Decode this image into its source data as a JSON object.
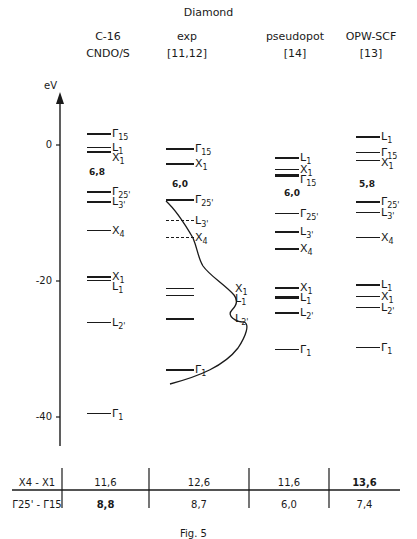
{
  "title": "Diamond",
  "axis": {
    "unit": "eV",
    "ticks": [
      {
        "label": "0",
        "value": 0
      },
      {
        "label": "-20",
        "value": -20
      },
      {
        "label": "-40",
        "value": -40
      }
    ]
  },
  "columns": [
    {
      "line1": "C-16",
      "line2": "CNDO/S",
      "gap": "6,8",
      "levels": [
        {
          "label": "Γ15",
          "e": 1.7
        },
        {
          "label": "L1",
          "e": -0.3
        },
        {
          "label": "X1",
          "e": -0.9
        },
        {
          "label": "Γ25'",
          "e": -6.8
        },
        {
          "label": "L3'",
          "e": -8.3
        },
        {
          "label": "X4",
          "e": -12.5
        },
        {
          "label": "X1",
          "e": -19.3
        },
        {
          "label": "L1",
          "e": -19.8
        },
        {
          "label": "L2'",
          "e": -26.0
        },
        {
          "label": "Γ1",
          "e": -39.4
        }
      ]
    },
    {
      "line1": "exp",
      "line2": "[11,12]",
      "gap": "6,0",
      "levels": [
        {
          "label": "Γ15",
          "e": -0.5
        },
        {
          "label": "X1",
          "e": -2.7
        },
        {
          "label": "Γ25'",
          "e": -8.0
        },
        {
          "label": "L3'",
          "e": -11.0,
          "dashed": true
        },
        {
          "label": "X4",
          "e": -13.5,
          "dashed": true
        },
        {
          "label": "X1",
          "e": -21.0
        },
        {
          "label": "L1",
          "e": -22.0
        },
        {
          "label": "L2'",
          "e": -25.5
        },
        {
          "label": "Γ1",
          "e": -33.0
        }
      ]
    },
    {
      "line1": "pseudopot",
      "line2": "[14]",
      "gap": "6,0",
      "levels": [
        {
          "label": "L1",
          "e": -1.8
        },
        {
          "label": "X1",
          "e": -3.5
        },
        {
          "label": "Γ15",
          "e": -4.2,
          "thick": true
        },
        {
          "label": "Γ25'",
          "e": -10.0
        },
        {
          "label": "L3'",
          "e": -12.7
        },
        {
          "label": "X4",
          "e": -15.2
        },
        {
          "label": "X1",
          "e": -20.9
        },
        {
          "label": "L1",
          "e": -22.2,
          "thick": true
        },
        {
          "label": "L2'",
          "e": -24.6
        },
        {
          "label": "Γ1",
          "e": -30.0
        }
      ]
    },
    {
      "line1": "OPW-SCF",
      "line2": "[13]",
      "gap": "5,8",
      "levels": [
        {
          "label": "L1",
          "e": 1.3
        },
        {
          "label": "Γ15",
          "e": -1.0
        },
        {
          "label": "X1",
          "e": -2.2
        },
        {
          "label": "Γ25'",
          "e": -8.3
        },
        {
          "label": "L3'",
          "e": -9.8
        },
        {
          "label": "X4",
          "e": -13.5
        },
        {
          "label": "L1",
          "e": -20.5
        },
        {
          "label": "X1",
          "e": -22.2
        },
        {
          "label": "L2'",
          "e": -23.8
        },
        {
          "label": "Γ1",
          "e": -29.7
        }
      ]
    }
  ],
  "table": {
    "rows": [
      {
        "label": "X4 - X1",
        "values": [
          "11,6",
          "12,6",
          "11,6",
          "13,6"
        ]
      },
      {
        "label": "Γ25' - Γ15",
        "values": [
          "8,8",
          "8,7",
          "6,0",
          "7,4"
        ]
      }
    ]
  },
  "caption": "Fig. 5"
}
